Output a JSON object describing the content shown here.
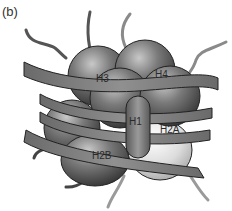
{
  "figure": {
    "panel_label": "(b)",
    "histones": [
      {
        "id": "H3",
        "label": "H3",
        "shade": "dark"
      },
      {
        "id": "H4",
        "label": "H4",
        "shade": "dark"
      },
      {
        "id": "H1",
        "label": "H1",
        "shade": "medium"
      },
      {
        "id": "H2A",
        "label": "H2A",
        "shade": "light"
      },
      {
        "id": "H2B",
        "label": "H2B",
        "shade": "dark"
      }
    ],
    "colors": {
      "dark_sphere": "#5a5a5a",
      "light_sphere": "#d8d8d8",
      "dna_ribbon": "#7a7a7a",
      "tail_dark": "#4a4a4a",
      "tail_light": "#9a9a9a"
    }
  }
}
